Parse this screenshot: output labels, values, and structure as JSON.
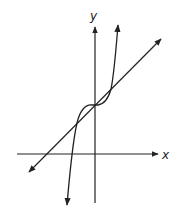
{
  "diagram": {
    "axes": {
      "x_label": "x",
      "y_label": "y"
    },
    "curves": [
      {
        "name": "line",
        "description": "straight line with positive slope, arrows at both ends"
      },
      {
        "name": "cubic",
        "description": "cubic curve with inflection point on y-axis, arrows at both ends"
      }
    ],
    "intersections": 3,
    "colors": {
      "stroke": "#222222",
      "background": "#ffffff"
    }
  }
}
